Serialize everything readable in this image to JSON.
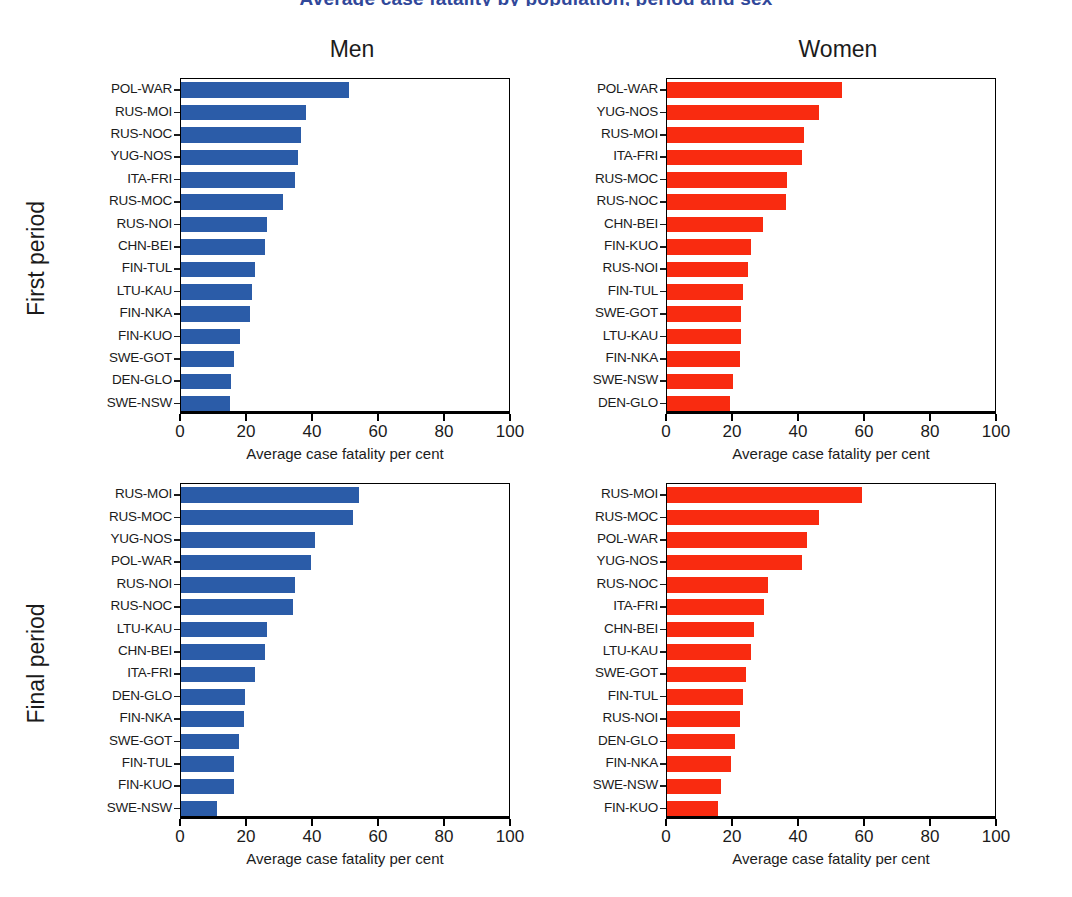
{
  "figure": {
    "title": "Average case fatality by population, period and sex",
    "column_headers": [
      "Men",
      "Women"
    ],
    "row_headers": [
      "First period",
      "Final period"
    ],
    "xaxis_title": "Average case fatality per cent",
    "xticks": [
      0,
      20,
      40,
      60,
      80,
      100
    ],
    "colors": {
      "men": "#2b5ca8",
      "women": "#f92b10",
      "axis": "#000000",
      "text": "#1b1b1b",
      "title": "#31489a"
    }
  },
  "chart_data": [
    {
      "type": "bar",
      "id": "first-period-men",
      "title": "Men",
      "subtitle": "First period",
      "orientation": "horizontal",
      "color": "#2b5ca8",
      "xlabel": "Average case fatality per cent",
      "ylabel": "",
      "xlim": [
        0,
        100
      ],
      "xticks": [
        0,
        20,
        40,
        60,
        80,
        100
      ],
      "grid": false,
      "legend": "none",
      "categories": [
        "POL-WAR",
        "RUS-MOI",
        "RUS-NOC",
        "YUG-NOS",
        "ITA-FRI",
        "RUS-MOC",
        "RUS-NOI",
        "CHN-BEI",
        "FIN-TUL",
        "LTU-KAU",
        "FIN-NKA",
        "FIN-KUO",
        "SWE-GOT",
        "DEN-GLO",
        "SWE-NSW"
      ],
      "values": [
        51.0,
        38.0,
        36.5,
        35.5,
        34.5,
        31.0,
        26.0,
        25.5,
        22.5,
        21.5,
        21.0,
        18.0,
        16.0,
        15.0,
        14.8
      ]
    },
    {
      "type": "bar",
      "id": "first-period-women",
      "title": "Women",
      "subtitle": "First period",
      "orientation": "horizontal",
      "color": "#f92b10",
      "xlabel": "Average case fatality per cent",
      "ylabel": "",
      "xlim": [
        0,
        100
      ],
      "xticks": [
        0,
        20,
        40,
        60,
        80,
        100
      ],
      "grid": false,
      "legend": "none",
      "categories": [
        "POL-WAR",
        "YUG-NOS",
        "RUS-MOI",
        "ITA-FRI",
        "RUS-MOC",
        "RUS-NOC",
        "CHN-BEI",
        "FIN-KUO",
        "RUS-NOI",
        "FIN-TUL",
        "SWE-GOT",
        "LTU-KAU",
        "FIN-NKA",
        "SWE-NSW",
        "DEN-GLO"
      ],
      "values": [
        53.0,
        46.0,
        41.5,
        41.0,
        36.5,
        36.0,
        29.0,
        25.5,
        24.5,
        23.0,
        22.5,
        22.5,
        22.0,
        20.0,
        19.0
      ]
    },
    {
      "type": "bar",
      "id": "final-period-men",
      "title": "Men",
      "subtitle": "Final period",
      "orientation": "horizontal",
      "color": "#2b5ca8",
      "xlabel": "Average case fatality per cent",
      "ylabel": "",
      "xlim": [
        0,
        100
      ],
      "xticks": [
        0,
        20,
        40,
        60,
        80,
        100
      ],
      "grid": false,
      "legend": "none",
      "categories": [
        "RUS-MOI",
        "RUS-MOC",
        "YUG-NOS",
        "POL-WAR",
        "RUS-NOI",
        "RUS-NOC",
        "LTU-KAU",
        "CHN-BEI",
        "ITA-FRI",
        "DEN-GLO",
        "FIN-NKA",
        "SWE-GOT",
        "FIN-TUL",
        "FIN-KUO",
        "SWE-NSW"
      ],
      "values": [
        54.0,
        52.0,
        40.5,
        39.5,
        34.5,
        34.0,
        26.0,
        25.5,
        22.5,
        19.5,
        19.0,
        17.5,
        16.0,
        16.0,
        11.0
      ]
    },
    {
      "type": "bar",
      "id": "final-period-women",
      "title": "Women",
      "subtitle": "Final period",
      "orientation": "horizontal",
      "color": "#f92b10",
      "xlabel": "Average case fatality per cent",
      "ylabel": "",
      "xlim": [
        0,
        100
      ],
      "xticks": [
        0,
        20,
        40,
        60,
        80,
        100
      ],
      "grid": false,
      "legend": "none",
      "categories": [
        "RUS-MOI",
        "RUS-MOC",
        "POL-WAR",
        "YUG-NOS",
        "RUS-NOC",
        "ITA-FRI",
        "CHN-BEI",
        "LTU-KAU",
        "SWE-GOT",
        "FIN-TUL",
        "RUS-NOI",
        "DEN-GLO",
        "FIN-NKA",
        "SWE-NSW",
        "FIN-KUO"
      ],
      "values": [
        59.0,
        46.0,
        42.5,
        41.0,
        30.5,
        29.5,
        26.5,
        25.5,
        24.0,
        23.0,
        22.0,
        20.5,
        19.5,
        16.5,
        15.5
      ]
    }
  ]
}
